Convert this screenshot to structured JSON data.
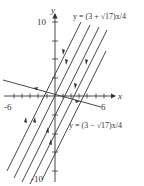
{
  "diagram": {
    "type": "phase-portrait",
    "axes": {
      "x_label": "x",
      "y_label": "y",
      "x_ticks_labeled": [
        "-6",
        "6"
      ],
      "y_ticks_labeled": [
        "10",
        "-10"
      ],
      "xlim": [
        -6.5,
        7
      ],
      "ylim": [
        -10.5,
        11
      ]
    },
    "eigenlines": [
      {
        "label": "y = (3 + √17)x/4",
        "slope": 1.78,
        "direction": "toward origin"
      },
      {
        "label": "y = (3 − √17)x/4",
        "slope": -0.28,
        "direction": "away from origin"
      }
    ],
    "trajectories_note": "parallel lines with arrows"
  },
  "colors": {
    "line": "#333333",
    "background": "#ffffff"
  }
}
